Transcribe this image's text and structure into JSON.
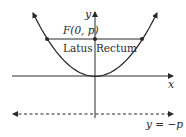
{
  "diagram": {
    "labels": {
      "y_axis": "y",
      "x_axis": "x",
      "focus": "F(0, p)",
      "latus_rectum": "Latus Rectum",
      "directrix": "y = −p"
    },
    "elements": {
      "parabola": "x^2 = 4py",
      "focus_point": "F(0, p)",
      "latus_rectum_endpoints": 2,
      "directrix_style": "dashed"
    },
    "colors": {
      "stroke": "#2a2a2a",
      "background": "#ffffff"
    }
  }
}
